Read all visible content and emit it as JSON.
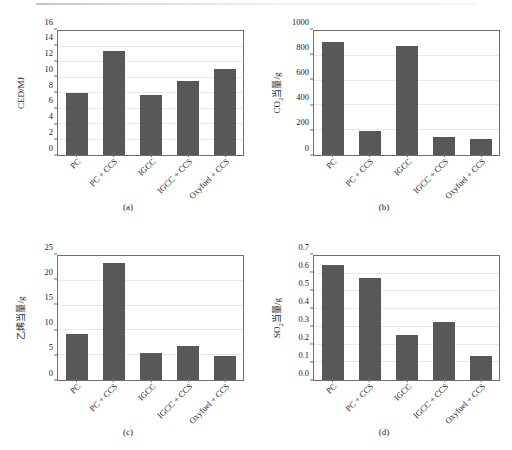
{
  "figure": {
    "background": "#ffffff",
    "bar_color": "#585858",
    "axis_color": "#6d6d6d",
    "grid_color": "#e8e8e8"
  },
  "categories": [
    "PC",
    "PC + CCS",
    "IGCC",
    "IGCC + CCS",
    "Oxyfuel + CCS"
  ],
  "panels": [
    {
      "caption": "(a)",
      "ylabel_main": "CED/MJ",
      "ylabel_sub": "",
      "ylabel_tail": "",
      "yticks": [
        "0",
        "2",
        "4",
        "6",
        "8",
        "10",
        "12",
        "14",
        "16"
      ]
    },
    {
      "caption": "(b)",
      "ylabel_main": "CO",
      "ylabel_sub": "2",
      "ylabel_tail": "当量/g",
      "yticks": [
        "0",
        "200",
        "400",
        "600",
        "800",
        "1000"
      ]
    },
    {
      "caption": "(c)",
      "ylabel_main": "乙烯当量/g",
      "ylabel_sub": "",
      "ylabel_tail": "",
      "yticks": [
        "0",
        "5",
        "10",
        "15",
        "20",
        "25"
      ]
    },
    {
      "caption": "(d)",
      "ylabel_main": "SO",
      "ylabel_sub": "2",
      "ylabel_tail": "当量/g",
      "yticks": [
        "0.0",
        "0.1",
        "0.2",
        "0.3",
        "0.4",
        "0.5",
        "0.6",
        "0.7"
      ]
    }
  ],
  "chart_data": [
    {
      "type": "bar",
      "panel": "(a)",
      "title": "",
      "xlabel": "",
      "ylabel": "CED/MJ",
      "categories": [
        "PC",
        "PC + CCS",
        "IGCC",
        "IGCC + CCS",
        "Oxyfuel + CCS"
      ],
      "values": [
        8.0,
        13.45,
        7.75,
        9.55,
        11.15
      ],
      "ylim": [
        0,
        16
      ],
      "ytick_values": [
        0,
        2,
        4,
        6,
        8,
        10,
        12,
        14,
        16
      ],
      "grid": true,
      "legend": "none"
    },
    {
      "type": "bar",
      "panel": "(b)",
      "title": "",
      "xlabel": "",
      "ylabel": "CO2当量/g",
      "categories": [
        "PC",
        "PC + CCS",
        "IGCC",
        "IGCC + CCS",
        "Oxyfuel + CCS"
      ],
      "values": [
        910,
        193,
        880,
        143,
        128
      ],
      "ylim": [
        0,
        1000
      ],
      "ytick_values": [
        0,
        200,
        400,
        600,
        800,
        1000
      ],
      "grid": true,
      "legend": "none"
    },
    {
      "type": "bar",
      "panel": "(c)",
      "title": "",
      "xlabel": "",
      "ylabel": "乙烯当量/g",
      "categories": [
        "PC",
        "PC + CCS",
        "IGCC",
        "IGCC + CCS",
        "Oxyfuel + CCS"
      ],
      "values": [
        9.3,
        23.5,
        5.4,
        6.9,
        4.75
      ],
      "ylim": [
        0,
        25
      ],
      "ytick_values": [
        0,
        5,
        10,
        15,
        20,
        25
      ],
      "grid": true,
      "legend": "none"
    },
    {
      "type": "bar",
      "panel": "(d)",
      "title": "",
      "xlabel": "",
      "ylabel": "SO2当量/g",
      "categories": [
        "PC",
        "PC + CCS",
        "IGCC",
        "IGCC + CCS",
        "Oxyfuel + CCS"
      ],
      "values": [
        0.648,
        0.578,
        0.253,
        0.328,
        0.138
      ],
      "ylim": [
        0,
        0.7
      ],
      "ytick_values": [
        0.0,
        0.1,
        0.2,
        0.3,
        0.4,
        0.5,
        0.6,
        0.7
      ],
      "grid": true,
      "legend": "none"
    }
  ]
}
